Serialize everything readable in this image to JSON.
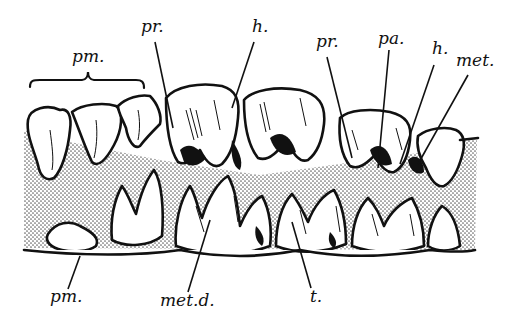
{
  "figure": {
    "colors": {
      "ink": "#111111",
      "background": "#ffffff",
      "stipple": "#8a8a8a"
    },
    "labels_top": [
      {
        "id": "pm-upper",
        "text": "pm.",
        "x": 72,
        "y": 57
      },
      {
        "id": "pr-1",
        "text": "pr.",
        "x": 141,
        "y": 27
      },
      {
        "id": "h-1",
        "text": "h.",
        "x": 252,
        "y": 27
      },
      {
        "id": "pr-2",
        "text": "pr.",
        "x": 316,
        "y": 42
      },
      {
        "id": "pa",
        "text": "pa.",
        "x": 378,
        "y": 35
      },
      {
        "id": "h-2",
        "text": "h.",
        "x": 432,
        "y": 45
      },
      {
        "id": "met",
        "text": "met.",
        "x": 458,
        "y": 57
      }
    ],
    "labels_bottom": [
      {
        "id": "pm-lower",
        "text": "pm.",
        "x": 50,
        "y": 295
      },
      {
        "id": "met-d",
        "text": "met.d.",
        "x": 160,
        "y": 297
      },
      {
        "id": "t",
        "text": "t.",
        "x": 310,
        "y": 292
      }
    ]
  }
}
